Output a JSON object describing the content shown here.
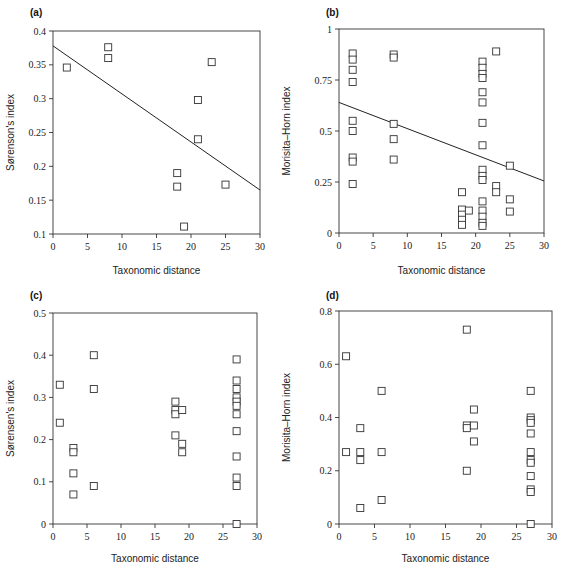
{
  "chart_data": [
    {
      "type": "scatter",
      "panel_label": "(a)",
      "title": "",
      "xlabel": "Taxonomic distance",
      "ylabel": "Sørenson's index",
      "xlim": [
        0,
        30
      ],
      "ylim": [
        0.1,
        0.4
      ],
      "xticks": [
        0,
        5,
        10,
        15,
        20,
        25,
        30
      ],
      "xtick_labels": [
        "0",
        "5",
        "10",
        "15",
        "20",
        "25",
        "30"
      ],
      "yticks": [
        0.1,
        0.15,
        0.2,
        0.25,
        0.3,
        0.35,
        0.4
      ],
      "ytick_labels": [
        "0.1",
        "0.15",
        "0.2",
        "0.25",
        "0.3",
        "0.35",
        "0.4"
      ],
      "grid": false,
      "points": [
        [
          2,
          0.346
        ],
        [
          8,
          0.376
        ],
        [
          8,
          0.36
        ],
        [
          23,
          0.354
        ],
        [
          21,
          0.298
        ],
        [
          21,
          0.24
        ],
        [
          18,
          0.19
        ],
        [
          18,
          0.17
        ],
        [
          25,
          0.173
        ],
        [
          19,
          0.111
        ]
      ],
      "fit_line": [
        [
          0,
          0.378
        ],
        [
          30,
          0.165
        ]
      ]
    },
    {
      "type": "scatter",
      "panel_label": "(b)",
      "title": "",
      "xlabel": "Taxonomic distance",
      "ylabel": "Morisita–Horn index",
      "xlim": [
        0,
        30
      ],
      "ylim": [
        0,
        1
      ],
      "xticks": [
        0,
        5,
        10,
        15,
        20,
        25,
        30
      ],
      "xtick_labels": [
        "0",
        "5",
        "10",
        "15",
        "20",
        "25",
        "30"
      ],
      "yticks": [
        0,
        0.25,
        0.5,
        0.75,
        1
      ],
      "ytick_labels": [
        "0",
        "0.25",
        "0.5",
        "0.75",
        "1"
      ],
      "grid": false,
      "points": [
        [
          2,
          0.88
        ],
        [
          2,
          0.85
        ],
        [
          2,
          0.8
        ],
        [
          2,
          0.74
        ],
        [
          2,
          0.55
        ],
        [
          2,
          0.5
        ],
        [
          2,
          0.37
        ],
        [
          2,
          0.35
        ],
        [
          2,
          0.24
        ],
        [
          8,
          0.875
        ],
        [
          8,
          0.86
        ],
        [
          8,
          0.535
        ],
        [
          8,
          0.46
        ],
        [
          8,
          0.36
        ],
        [
          18,
          0.2
        ],
        [
          18,
          0.115
        ],
        [
          18,
          0.09
        ],
        [
          18,
          0.065
        ],
        [
          18,
          0.04
        ],
        [
          19,
          0.11
        ],
        [
          21,
          0.84
        ],
        [
          21,
          0.81
        ],
        [
          21,
          0.78
        ],
        [
          21,
          0.76
        ],
        [
          21,
          0.69
        ],
        [
          21,
          0.64
        ],
        [
          21,
          0.54
        ],
        [
          21,
          0.43
        ],
        [
          21,
          0.31
        ],
        [
          21,
          0.28
        ],
        [
          21,
          0.26
        ],
        [
          21,
          0.155
        ],
        [
          21,
          0.11
        ],
        [
          21,
          0.08
        ],
        [
          21,
          0.05
        ],
        [
          21,
          0.035
        ],
        [
          23,
          0.89
        ],
        [
          23,
          0.23
        ],
        [
          23,
          0.2
        ],
        [
          25,
          0.33
        ],
        [
          25,
          0.165
        ],
        [
          25,
          0.105
        ]
      ],
      "fit_line": [
        [
          0,
          0.64
        ],
        [
          30,
          0.255
        ]
      ]
    },
    {
      "type": "scatter",
      "panel_label": "(c)",
      "title": "",
      "xlabel": "Taxonomic distance",
      "ylabel": "Sørensen's index",
      "xlim": [
        0,
        30
      ],
      "ylim": [
        0,
        0.5
      ],
      "xticks": [
        0,
        5,
        10,
        15,
        20,
        25,
        30
      ],
      "xtick_labels": [
        "0",
        "5",
        "10",
        "15",
        "20",
        "25",
        "30"
      ],
      "yticks": [
        0,
        0.1,
        0.2,
        0.3,
        0.4,
        0.5
      ],
      "ytick_labels": [
        "0",
        "0.1",
        "0.2",
        "0.3",
        "0.4",
        "0.5"
      ],
      "grid": false,
      "points": [
        [
          1,
          0.33
        ],
        [
          1,
          0.24
        ],
        [
          3,
          0.18
        ],
        [
          3,
          0.17
        ],
        [
          3,
          0.12
        ],
        [
          3,
          0.07
        ],
        [
          6,
          0.4
        ],
        [
          6,
          0.32
        ],
        [
          6,
          0.09
        ],
        [
          18,
          0.29
        ],
        [
          18,
          0.27
        ],
        [
          18,
          0.26
        ],
        [
          18,
          0.21
        ],
        [
          19,
          0.27
        ],
        [
          19,
          0.19
        ],
        [
          19,
          0.17
        ],
        [
          27,
          0.39
        ],
        [
          27,
          0.34
        ],
        [
          27,
          0.32
        ],
        [
          27,
          0.3
        ],
        [
          27,
          0.29
        ],
        [
          27,
          0.28
        ],
        [
          27,
          0.26
        ],
        [
          27,
          0.22
        ],
        [
          27,
          0.16
        ],
        [
          27,
          0.11
        ],
        [
          27,
          0.09
        ],
        [
          27,
          0.0
        ]
      ]
    },
    {
      "type": "scatter",
      "panel_label": "(d)",
      "title": "",
      "xlabel": "Taxonomic distance",
      "ylabel": "Morisita–Horn index",
      "xlim": [
        0,
        30
      ],
      "ylim": [
        0,
        0.8
      ],
      "xticks": [
        0,
        5,
        10,
        15,
        20,
        25,
        30
      ],
      "xtick_labels": [
        "0",
        "5",
        "10",
        "15",
        "20",
        "25",
        "30"
      ],
      "yticks": [
        0,
        0.2,
        0.4,
        0.6,
        0.8
      ],
      "ytick_labels": [
        "0",
        "0.2",
        "0.4",
        "0.6",
        "0.8"
      ],
      "grid": false,
      "points": [
        [
          1,
          0.63
        ],
        [
          1,
          0.27
        ],
        [
          3,
          0.36
        ],
        [
          3,
          0.27
        ],
        [
          3,
          0.24
        ],
        [
          3,
          0.06
        ],
        [
          6,
          0.5
        ],
        [
          6,
          0.27
        ],
        [
          6,
          0.09
        ],
        [
          18,
          0.73
        ],
        [
          18,
          0.37
        ],
        [
          18,
          0.36
        ],
        [
          18,
          0.2
        ],
        [
          19,
          0.43
        ],
        [
          19,
          0.37
        ],
        [
          19,
          0.31
        ],
        [
          27,
          0.5
        ],
        [
          27,
          0.4
        ],
        [
          27,
          0.39
        ],
        [
          27,
          0.38
        ],
        [
          27,
          0.34
        ],
        [
          27,
          0.27
        ],
        [
          27,
          0.24
        ],
        [
          27,
          0.23
        ],
        [
          27,
          0.18
        ],
        [
          27,
          0.13
        ],
        [
          27,
          0.12
        ],
        [
          27,
          0.0
        ]
      ]
    }
  ]
}
